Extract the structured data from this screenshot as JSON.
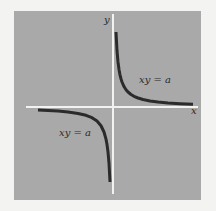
{
  "figure": {
    "type": "diagram",
    "title": "",
    "background_color": "#a9a9a9",
    "page_color": "#f3f3f1",
    "axis_color": "#f2f2f0",
    "curve_color": "#2b2b2b",
    "axes": {
      "x_label": "x",
      "y_label": "y"
    },
    "curves": [
      {
        "name": "hyperbola-branch-quadrant-1",
        "equation": "xy = a",
        "label": "xy = a",
        "quadrant": "I"
      },
      {
        "name": "hyperbola-branch-quadrant-3",
        "equation": "xy = a",
        "label": "xy = a",
        "quadrant": "III"
      }
    ]
  }
}
